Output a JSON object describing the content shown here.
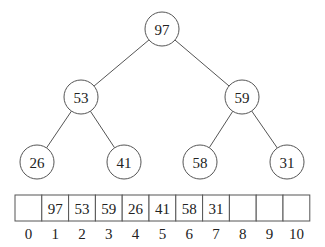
{
  "tree": {
    "nodes": [
      {
        "id": "n1",
        "value": "97",
        "cx": 162,
        "cy": 29
      },
      {
        "id": "n2",
        "value": "53",
        "cx": 81,
        "cy": 97
      },
      {
        "id": "n3",
        "value": "59",
        "cx": 242,
        "cy": 97
      },
      {
        "id": "n4",
        "value": "26",
        "cx": 37,
        "cy": 162
      },
      {
        "id": "n5",
        "value": "41",
        "cx": 124,
        "cy": 162
      },
      {
        "id": "n6",
        "value": "58",
        "cx": 200,
        "cy": 162
      },
      {
        "id": "n7",
        "value": "31",
        "cx": 287,
        "cy": 162
      }
    ],
    "edges": [
      [
        "n1",
        "n2"
      ],
      [
        "n1",
        "n3"
      ],
      [
        "n2",
        "n4"
      ],
      [
        "n2",
        "n5"
      ],
      [
        "n3",
        "n6"
      ],
      [
        "n3",
        "n7"
      ]
    ],
    "radius": 17
  },
  "array": {
    "values": [
      "",
      "97",
      "53",
      "59",
      "26",
      "41",
      "58",
      "31",
      "",
      "",
      ""
    ],
    "indices": [
      "0",
      "1",
      "2",
      "3",
      "4",
      "5",
      "6",
      "7",
      "8",
      "9",
      "10"
    ],
    "x": 15,
    "y": 195,
    "cell_width": 26.8,
    "cell_height": 26
  },
  "colors": {
    "stroke": "#555555",
    "text": "#222222",
    "background": "#ffffff"
  }
}
